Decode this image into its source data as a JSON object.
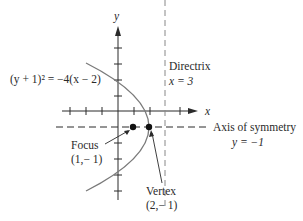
{
  "diagram": {
    "equation_label": "(y + 1)² = −4(x − 2)",
    "axes": {
      "x_label": "x",
      "y_label": "y"
    },
    "directrix": {
      "title": "Directrix",
      "equation": "x = 3"
    },
    "axis_of_symmetry": {
      "title": "Axis of symmetry",
      "equation": "y = −1"
    },
    "focus": {
      "title": "Focus",
      "coords": "(1,− 1)"
    },
    "vertex": {
      "title": "Vertex",
      "coords": "(2,− 1)"
    },
    "colors": {
      "curve": "#7a7a7a",
      "axes": "#2a2a2a",
      "points": "#111111",
      "dashed": "#555555"
    }
  }
}
